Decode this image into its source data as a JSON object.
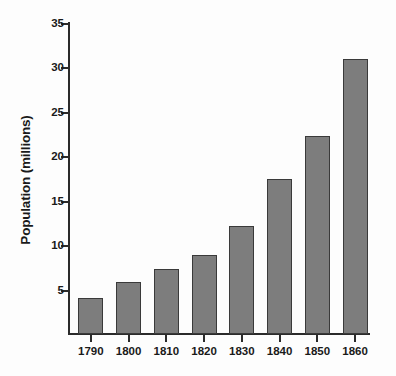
{
  "chart_data": {
    "type": "bar",
    "title": "",
    "xlabel": "",
    "ylabel": "Population (millions)",
    "categories": [
      "1790",
      "1800",
      "1810",
      "1820",
      "1830",
      "1840",
      "1850",
      "1860"
    ],
    "values": [
      4.0,
      5.9,
      7.3,
      8.9,
      12.1,
      17.4,
      22.3,
      31.0
    ],
    "ylim": [
      0,
      35
    ],
    "yticks": [
      5,
      10,
      15,
      20,
      25,
      30,
      35
    ],
    "ytick_labels": [
      "5",
      "10",
      "15",
      "20",
      "25",
      "30",
      "35"
    ],
    "grid": false,
    "legend": null,
    "bar_color": "#7d7d7d",
    "bar_edge_color": "#3a3a3a",
    "axis_color": "#2b2b2b",
    "background_color": "#fdfdfd"
  }
}
